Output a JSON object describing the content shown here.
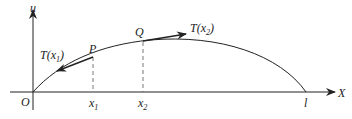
{
  "diagram": {
    "axes": {
      "y_label": "u",
      "x_label": "X",
      "origin_label": "O"
    },
    "points": {
      "p_label": "P",
      "q_label": "Q"
    },
    "ticks": {
      "x1_base": "x",
      "x1_sub": "1",
      "x2_base": "x",
      "x2_sub": "2",
      "end_label": "l"
    },
    "tensions": {
      "t1_prefix": "T(x",
      "t1_sub": "1",
      "t1_suffix": ")",
      "t2_prefix": "T(x",
      "t2_sub": "2",
      "t2_suffix": ")"
    },
    "colors": {
      "stroke": "#222222",
      "dashed": "#555555"
    }
  }
}
